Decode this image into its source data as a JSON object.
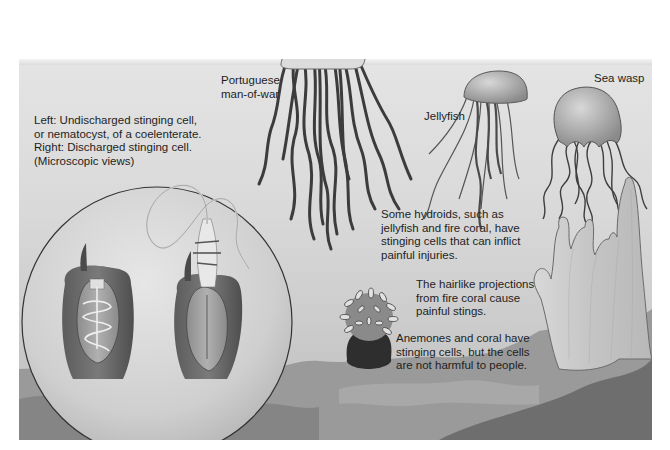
{
  "figure": {
    "colors": {
      "background_light": "#e4e4e4",
      "background_dark": "#bdbdbd",
      "seafloor": "#8f8f8f",
      "seafloor_dark": "#6e6e6e",
      "text": "#1e1e1e",
      "outline": "#3a3a3a"
    },
    "organisms": [
      {
        "id": "portuguese-man-of-war",
        "icon": "man-of-war-illustration"
      },
      {
        "id": "jellyfish",
        "icon": "jellyfish-illustration"
      },
      {
        "id": "sea-wasp",
        "icon": "box-jellyfish-illustration"
      },
      {
        "id": "anemone",
        "icon": "sea-anemone-illustration"
      },
      {
        "id": "fire-coral",
        "icon": "fire-coral-illustration"
      },
      {
        "id": "nematocyst-inset",
        "icon": "microscopic-inset-circle"
      }
    ],
    "labels": {
      "nematocyst_caption": "Left: Undischarged stinging cell,\nor nematocyst, of a coelenterate.\nRight: Discharged stinging cell.\n(Microscopic views)",
      "man_of_war": "Portuguese\nman-of-war",
      "jellyfish": "Jellyfish",
      "sea_wasp": "Sea wasp",
      "hydroids": "Some hydroids, such as\njellyfish and fire coral, have\nstinging cells that can inflict\npainful injuries.",
      "fire_coral": "The hairlike projections\nfrom fire coral cause\npainful stings.",
      "anemones": "Anemones and coral have\nstinging cells, but the cells\nare not harmful to people."
    }
  }
}
